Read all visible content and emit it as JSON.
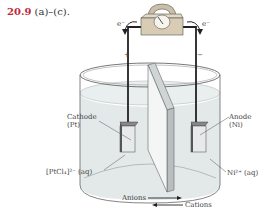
{
  "heading": {
    "number": "20.9",
    "text": "(a)–(c)."
  },
  "diagram": {
    "electron_left": "e⁻",
    "electron_right": "e⁻",
    "plus": "+",
    "minus": "−",
    "cathode_label": "Cathode",
    "cathode_material": "(Pt)",
    "anode_label": "Anode",
    "anode_material": "(Ni)",
    "left_solution": "[PtCl₄]²⁻ (aq)",
    "right_solution": "Ni²⁺ (aq)",
    "anions": "Anions",
    "cations": "Cations"
  },
  "colors": {
    "heading_number": "#c0283a",
    "meter": "#d8ccb4",
    "solution": "#dfe6e6"
  }
}
